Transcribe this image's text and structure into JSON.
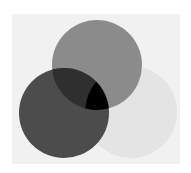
{
  "diagram": {
    "type": "venn",
    "background": {
      "x": 12,
      "y": 14,
      "width": 168,
      "height": 150,
      "color": "#f1f1f1"
    },
    "circles": [
      {
        "id": "light",
        "cx": 131,
        "cy": 112,
        "r": 46,
        "color": "#e4e4e4"
      },
      {
        "id": "top",
        "cx": 97,
        "cy": 65,
        "r": 45,
        "color": "#8b8b8b"
      },
      {
        "id": "left",
        "cx": 64,
        "cy": 113,
        "r": 45,
        "color": "#4c4c4c"
      }
    ],
    "overlaps": {
      "top_left": "#2f2f2f",
      "top_left_light": "#000000"
    }
  }
}
